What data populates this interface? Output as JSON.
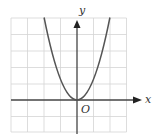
{
  "figure": {
    "type": "coordinate-plane-graph",
    "x_axis_label": "x",
    "y_axis_label": "y",
    "origin_label": "O",
    "grid": {
      "columns": 7,
      "rows": 7,
      "visible": true
    },
    "curve": {
      "shape": "parabola",
      "opens": "up",
      "vertex": [
        0,
        0
      ]
    },
    "colors": {
      "grid": "#d4d4d4",
      "axis": "#444444",
      "curve": "#555555",
      "background": "#ffffff"
    }
  }
}
